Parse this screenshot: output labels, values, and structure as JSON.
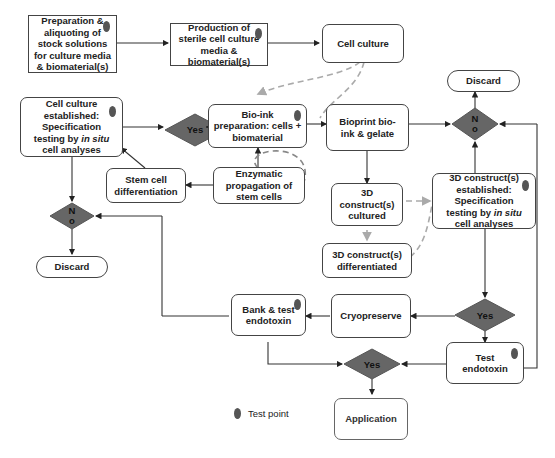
{
  "nodes": {
    "prep_stock": "Preparation &\naliquoting of\nstock solutions\nfor culture media\n& biomaterial(s)",
    "production_media": "Production of\nsterile cell culture\nmedia &\nbiomaterial(s)",
    "cell_culture": "Cell culture",
    "cell_culture_established_pre": "Cell culture\nestablished:\nSpecification\ntesting by ",
    "cell_culture_established_italic": "in situ",
    "cell_culture_established_post": "\ncell analyses",
    "bioink_prep": "Bio-ink\npreparation: cells +\nbiomaterial",
    "bioprint": "Bioprint bio-\nink & gelate",
    "discard_top": "Discard",
    "stem_cell_diff": "Stem cell\ndifferentiation",
    "enzymatic_prop": "Enzymatic\npropagation of\nstem cells",
    "construct_cultured": "3D\nconstruct(s)\ncultured",
    "construct_established_pre": "3D construct(s)\nestablished:\nSpecification\ntesting by ",
    "construct_established_italic": "in situ",
    "construct_established_post": "\ncell analyses",
    "construct_differentiated": "3D construct(s)\ndifferentiated",
    "discard_left": "Discard",
    "bank_test": "Bank & test\nendotoxin",
    "cryopreserve": "Cryopreserve",
    "test_endotoxin": "Test\nendotoxin",
    "application": "Application"
  },
  "decisions": {
    "yes_top": "Yes",
    "no_right": "N\no",
    "no_left": "N\no",
    "yes_right": "Yes",
    "yes_bottom": "Yes"
  },
  "legend": {
    "test_point_label": "Test point"
  },
  "colors": {
    "diamond_fill": "#666666",
    "test_point": "#555555",
    "dashed_arrow": "#aaaaaa",
    "line": "#333333"
  }
}
